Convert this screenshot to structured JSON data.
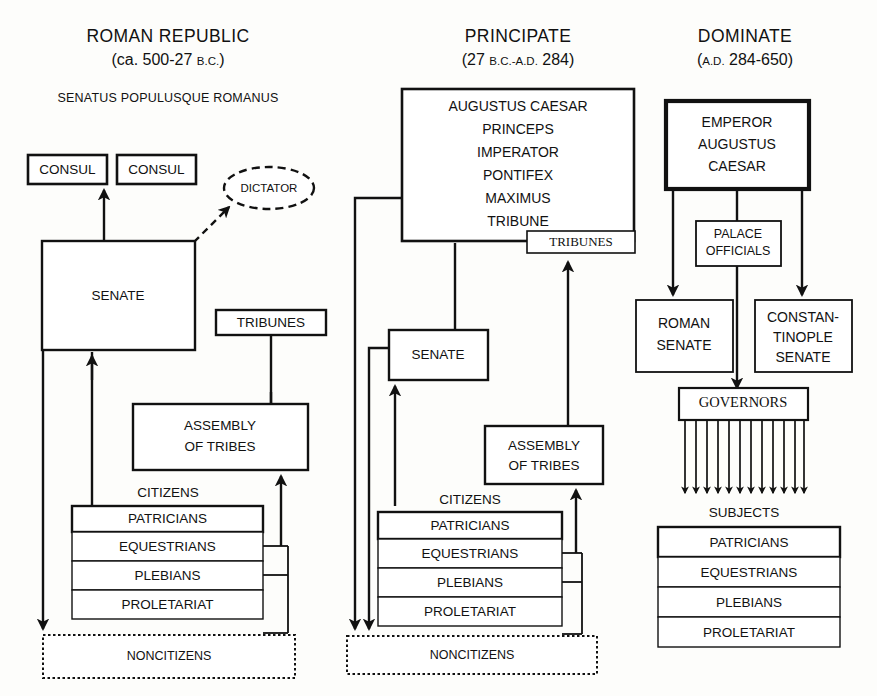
{
  "columns": [
    {
      "id": "roman-republic",
      "title": "ROMAN REPUBLIC",
      "date_prefix": "(ca. 500-27 ",
      "date_era": "B.C.",
      "date_suffix": ")",
      "motto": "SENATUS POPULUSQUE ROMANUS",
      "nodes": {
        "consul_left": "CONSUL",
        "consul_right": "CONSUL",
        "dictator": "DICTATOR",
        "senate": "SENATE",
        "tribunes": "TRIBUNES",
        "assembly_line1": "ASSEMBLY",
        "assembly_line2": "OF TRIBES",
        "citizens": "CITIZENS",
        "noncitizens": "NONCITIZENS"
      },
      "classes": [
        "PATRICIANS",
        "EQUESTRIANS",
        "PLEBIANS",
        "PROLETARIAT"
      ]
    },
    {
      "id": "principate",
      "title": "PRINCIPATE",
      "date_prefix": "(27 ",
      "date_era": "B.C.-A.D.",
      "date_suffix": " 284)",
      "nodes": {
        "ruler_line1": "AUGUSTUS CAESAR",
        "ruler_line2": "PRINCEPS",
        "ruler_line3": "IMPERATOR",
        "ruler_line4": "PONTIFEX",
        "ruler_line5": "MAXIMUS",
        "ruler_line6": "TRIBUNE",
        "tribunes": "TRIBUNES",
        "senate": "SENATE",
        "assembly_line1": "ASSEMBLY",
        "assembly_line2": "OF TRIBES",
        "citizens": "CITIZENS",
        "noncitizens": "NONCITIZENS"
      },
      "classes": [
        "PATRICIANS",
        "EQUESTRIANS",
        "PLEBIANS",
        "PROLETARIAT"
      ]
    },
    {
      "id": "dominate",
      "title": "DOMINATE",
      "date_prefix": "(",
      "date_era": "A.D.",
      "date_suffix": " 284-650)",
      "nodes": {
        "emperor_line1": "EMPEROR",
        "emperor_line2": "AUGUSTUS",
        "emperor_line3": "CAESAR",
        "palace_line1": "PALACE",
        "palace_line2": "OFFICIALS",
        "roman_senate_line1": "ROMAN",
        "roman_senate_line2": "SENATE",
        "constantinople_line1": "CONSTAN-",
        "constantinople_line2": "TINOPLE",
        "constantinople_line3": "SENATE",
        "governors": "GOVERNORS",
        "subjects": "SUBJECTS"
      },
      "classes": [
        "PATRICIANS",
        "EQUESTRIANS",
        "PLEBIANS",
        "PROLETARIAT"
      ]
    }
  ],
  "colors": {
    "ink": "#111111",
    "paper": "#fdfdfb",
    "box_fill": "#ffffff"
  }
}
